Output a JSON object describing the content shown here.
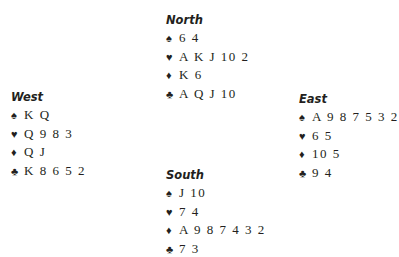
{
  "suits": {
    "spades": "♠",
    "hearts": "♥",
    "diamonds": "♦",
    "clubs": "♣"
  },
  "hands": {
    "north": {
      "title": "North",
      "spades": "6 4",
      "hearts": "A K J 10 2",
      "diamonds": "K 6",
      "clubs": "A Q J 10"
    },
    "west": {
      "title": "West",
      "spades": "K Q",
      "hearts": "Q 9 8 3",
      "diamonds": "Q J",
      "clubs": "K 8 6 5 2"
    },
    "east": {
      "title": "East",
      "spades": "A 9 8 7 5 3 2",
      "hearts": "6 5",
      "diamonds": "10 5",
      "clubs": "9 4"
    },
    "south": {
      "title": "South",
      "spades": "J 10",
      "hearts": "7 4",
      "diamonds": "A 9 8 7 4 3 2",
      "clubs": "7 3"
    }
  }
}
